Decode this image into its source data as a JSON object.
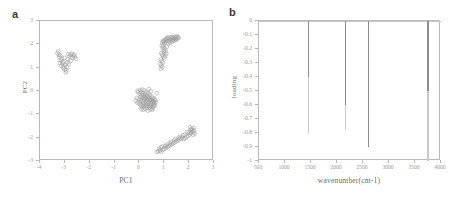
{
  "figure": {
    "background": "#ffffff",
    "marker_color": "#9a9a9a",
    "axis_color": "#b9b9b9",
    "tick_label_color": "#9a9a9a"
  },
  "panels": [
    {
      "letter": "a",
      "name": "pca-scores-plot",
      "chart_data": {
        "type": "scatter",
        "title": "",
        "xlabel": "PC1",
        "ylabel": "PC2",
        "xlim": [
          -4,
          3
        ],
        "ylim": [
          -3,
          3
        ],
        "xticks": [
          -4,
          -3,
          -2,
          -1,
          0,
          1,
          2,
          3
        ],
        "xtick_labels": [
          "-4",
          "-3",
          "-2",
          "-1",
          "0",
          "1",
          "2",
          "3"
        ],
        "yticks": [
          -3,
          -2,
          -1,
          0,
          1,
          2,
          3
        ],
        "ytick_labels": [
          "-3",
          "-2",
          "-1",
          "0",
          "1",
          "2",
          "3"
        ],
        "grid": false,
        "legend": "none",
        "marker": "open-circle",
        "clusters": [
          {
            "name": "left-cluster",
            "points": [
              [
                -3.3,
                1.62
              ],
              [
                -3.22,
                1.45
              ],
              [
                -3.16,
                1.3
              ],
              [
                -3.1,
                1.18
              ],
              [
                -3.05,
                1.05
              ],
              [
                -3.0,
                0.92
              ],
              [
                -2.96,
                0.8
              ],
              [
                -3.12,
                1.38
              ],
              [
                -3.18,
                1.52
              ],
              [
                -3.24,
                1.55
              ],
              [
                -3.08,
                1.25
              ],
              [
                -2.98,
                1.12
              ],
              [
                -2.92,
                1.02
              ],
              [
                -2.88,
                1.35
              ],
              [
                -2.82,
                1.48
              ],
              [
                -2.78,
                1.55
              ],
              [
                -2.72,
                1.6
              ],
              [
                -2.66,
                1.52
              ],
              [
                -2.6,
                1.45
              ],
              [
                -2.55,
                1.38
              ],
              [
                -2.9,
                1.22
              ],
              [
                -2.85,
                1.15
              ],
              [
                -3.02,
                1.42
              ],
              [
                -3.14,
                1.08
              ],
              [
                -2.94,
                0.88
              ],
              [
                -3.26,
                1.7
              ],
              [
                -2.7,
                1.42
              ],
              [
                -2.62,
                1.56
              ],
              [
                -3.2,
                1.2
              ],
              [
                -3.06,
                0.98
              ],
              [
                -2.76,
                1.3
              ],
              [
                -2.86,
                1.58
              ]
            ]
          },
          {
            "name": "center-cluster",
            "points": [
              [
                -0.05,
                -0.05
              ],
              [
                0.02,
                -0.12
              ],
              [
                0.1,
                -0.18
              ],
              [
                0.18,
                -0.22
              ],
              [
                0.25,
                -0.28
              ],
              [
                0.32,
                -0.32
              ],
              [
                0.38,
                -0.36
              ],
              [
                0.42,
                -0.4
              ],
              [
                0.48,
                -0.44
              ],
              [
                0.52,
                -0.48
              ],
              [
                0.3,
                -0.2
              ],
              [
                0.22,
                -0.15
              ],
              [
                0.15,
                -0.1
              ],
              [
                0.08,
                -0.06
              ],
              [
                0.36,
                -0.26
              ],
              [
                0.44,
                -0.33
              ],
              [
                0.5,
                -0.38
              ],
              [
                0.55,
                -0.42
              ],
              [
                0.58,
                -0.46
              ],
              [
                0.6,
                -0.52
              ],
              [
                0.34,
                -0.55
              ],
              [
                0.28,
                -0.58
              ],
              [
                0.22,
                -0.62
              ],
              [
                0.16,
                -0.66
              ],
              [
                0.1,
                -0.7
              ],
              [
                0.4,
                -0.6
              ],
              [
                0.46,
                -0.64
              ],
              [
                0.52,
                -0.68
              ],
              [
                0.3,
                -0.72
              ],
              [
                0.24,
                -0.76
              ],
              [
                0.44,
                -0.78
              ],
              [
                0.5,
                -0.8
              ],
              [
                0.14,
                -0.45
              ],
              [
                0.06,
                -0.4
              ],
              [
                -0.02,
                -0.35
              ],
              [
                -0.1,
                -0.3
              ],
              [
                -0.15,
                -0.42
              ],
              [
                -0.08,
                -0.5
              ],
              [
                0.0,
                -0.56
              ],
              [
                0.12,
                -0.3
              ],
              [
                0.26,
                -0.44
              ],
              [
                0.36,
                -0.48
              ],
              [
                0.2,
                -0.52
              ],
              [
                0.06,
                -0.62
              ],
              [
                0.56,
                -0.58
              ],
              [
                0.62,
                -0.62
              ],
              [
                0.18,
                -0.38
              ],
              [
                0.04,
                -0.25
              ],
              [
                0.42,
                -0.16
              ],
              [
                0.34,
                -0.1
              ],
              [
                0.28,
                -0.04
              ],
              [
                0.2,
                0.02
              ],
              [
                0.12,
                0.06
              ],
              [
                0.48,
                -0.24
              ],
              [
                0.54,
                -0.3
              ],
              [
                0.6,
                -0.34
              ],
              [
                0.02,
                0.04
              ],
              [
                -0.08,
                0.0
              ],
              [
                0.66,
                -0.48
              ],
              [
                0.64,
                -0.4
              ],
              [
                0.38,
                0.08
              ],
              [
                0.7,
                -0.1
              ],
              [
                0.46,
                -0.02
              ],
              [
                0.3,
                -0.64
              ],
              [
                0.16,
                -0.8
              ],
              [
                0.34,
                -0.84
              ],
              [
                0.08,
                -0.78
              ],
              [
                0.52,
                -0.74
              ],
              [
                0.24,
                -0.34
              ],
              [
                0.4,
                -0.7
              ],
              [
                0.58,
                -0.66
              ],
              [
                0.14,
                -0.58
              ],
              [
                0.02,
                -0.48
              ],
              [
                0.46,
                -0.54
              ],
              [
                0.32,
                -0.4
              ],
              [
                0.2,
                -0.26
              ]
            ]
          },
          {
            "name": "upper-right-cluster",
            "points": [
              [
                0.92,
                2.08
              ],
              [
                0.98,
                2.12
              ],
              [
                1.02,
                2.18
              ],
              [
                1.06,
                2.22
              ],
              [
                1.1,
                2.26
              ],
              [
                1.14,
                2.3
              ],
              [
                1.18,
                2.26
              ],
              [
                1.22,
                2.22
              ],
              [
                1.26,
                2.28
              ],
              [
                1.3,
                2.32
              ],
              [
                1.34,
                2.3
              ],
              [
                1.38,
                2.26
              ],
              [
                1.42,
                2.32
              ],
              [
                1.46,
                2.28
              ],
              [
                1.5,
                2.34
              ],
              [
                1.54,
                2.3
              ],
              [
                0.95,
                2.15
              ],
              [
                1.0,
                2.05
              ],
              [
                1.05,
                2.1
              ],
              [
                1.12,
                2.16
              ],
              [
                1.2,
                2.12
              ],
              [
                1.28,
                2.18
              ],
              [
                1.36,
                2.2
              ],
              [
                1.44,
                2.22
              ],
              [
                0.9,
                1.95
              ],
              [
                0.94,
                1.85
              ],
              [
                0.98,
                1.75
              ],
              [
                1.02,
                1.82
              ],
              [
                1.06,
                1.7
              ],
              [
                0.88,
                1.62
              ],
              [
                0.92,
                1.55
              ],
              [
                0.96,
                1.48
              ],
              [
                1.0,
                1.42
              ],
              [
                0.86,
                1.35
              ],
              [
                0.9,
                1.28
              ],
              [
                0.94,
                1.22
              ],
              [
                0.84,
                1.15
              ],
              [
                0.88,
                1.08
              ],
              [
                0.92,
                1.02
              ],
              [
                0.86,
                0.95
              ],
              [
                1.08,
                1.6
              ],
              [
                1.04,
                1.5
              ],
              [
                0.98,
                1.65
              ],
              [
                1.1,
                1.9
              ],
              [
                1.16,
                2.02
              ],
              [
                1.24,
                2.06
              ],
              [
                1.32,
                2.12
              ],
              [
                1.4,
                2.16
              ],
              [
                1.48,
                2.2
              ],
              [
                1.52,
                2.24
              ],
              [
                1.58,
                2.28
              ],
              [
                0.96,
                1.92
              ]
            ]
          },
          {
            "name": "lower-right-cluster",
            "points": [
              [
                0.7,
                -2.62
              ],
              [
                0.76,
                -2.58
              ],
              [
                0.82,
                -2.55
              ],
              [
                0.88,
                -2.6
              ],
              [
                0.94,
                -2.52
              ],
              [
                1.0,
                -2.48
              ],
              [
                1.06,
                -2.44
              ],
              [
                1.12,
                -2.4
              ],
              [
                1.18,
                -2.36
              ],
              [
                1.24,
                -2.32
              ],
              [
                1.3,
                -2.28
              ],
              [
                1.36,
                -2.24
              ],
              [
                1.42,
                -2.2
              ],
              [
                1.48,
                -2.16
              ],
              [
                1.54,
                -2.12
              ],
              [
                1.6,
                -2.08
              ],
              [
                1.66,
                -2.04
              ],
              [
                1.72,
                -2.0
              ],
              [
                1.78,
                -2.06
              ],
              [
                1.84,
                -2.02
              ],
              [
                1.9,
                -1.96
              ],
              [
                1.96,
                -1.92
              ],
              [
                2.02,
                -1.86
              ],
              [
                2.08,
                -1.8
              ],
              [
                2.14,
                -1.74
              ],
              [
                2.2,
                -1.7
              ],
              [
                2.1,
                -1.62
              ],
              [
                2.04,
                -1.56
              ],
              [
                2.16,
                -1.88
              ],
              [
                2.22,
                -1.82
              ],
              [
                0.8,
                -2.48
              ],
              [
                0.86,
                -2.42
              ],
              [
                1.04,
                -2.36
              ],
              [
                1.22,
                -2.24
              ],
              [
                1.4,
                -2.12
              ],
              [
                1.58,
                -2.0
              ],
              [
                1.76,
                -1.9
              ],
              [
                1.94,
                -1.78
              ],
              [
                2.12,
                -1.68
              ],
              [
                2.18,
                -1.58
              ],
              [
                0.92,
                -2.38
              ],
              [
                1.1,
                -2.3
              ],
              [
                1.28,
                -2.18
              ],
              [
                1.46,
                -2.06
              ],
              [
                1.64,
                -1.96
              ],
              [
                1.82,
                -1.86
              ],
              [
                2.0,
                -1.76
              ],
              [
                2.06,
                -1.66
              ]
            ]
          }
        ]
      }
    },
    {
      "letter": "b",
      "name": "pca-loading-plot",
      "chart_data": {
        "type": "line",
        "title": "",
        "xlabel": "wavenumber(cm-1)",
        "ylabel": "loading",
        "xlim": [
          500,
          4000
        ],
        "ylim": [
          -1,
          0
        ],
        "xticks": [
          500,
          1000,
          1500,
          2000,
          2500,
          3000,
          3500,
          4000
        ],
        "xtick_labels": [
          "500",
          "1000",
          "1500",
          "2000",
          "2500",
          "3000",
          "3500",
          "4000"
        ],
        "yticks": [
          0,
          -0.1,
          -0.2,
          -0.3,
          -0.4,
          -0.5,
          -0.6,
          -0.7,
          -0.8,
          -0.9,
          -1
        ],
        "ytick_labels": [
          "0",
          "-0.1",
          "-0.2",
          "-0.3",
          "-0.4",
          "-0.5",
          "-0.6",
          "-0.7",
          "-0.8",
          "-0.9",
          "-1"
        ],
        "grid": false,
        "legend": "none",
        "baseline": 0,
        "peaks": [
          {
            "wavenumber": 1450,
            "loading": -0.8,
            "dark_to": -0.4,
            "width": 1.0
          },
          {
            "wavenumber": 2160,
            "loading": -0.78,
            "dark_to": -0.6,
            "width": 1.2
          },
          {
            "wavenumber": 2600,
            "loading": -0.9,
            "dark_to": -0.9,
            "width": 0.8
          },
          {
            "wavenumber": 3750,
            "loading": -1.0,
            "dark_to": -0.5,
            "width": 2.4
          }
        ]
      }
    }
  ]
}
